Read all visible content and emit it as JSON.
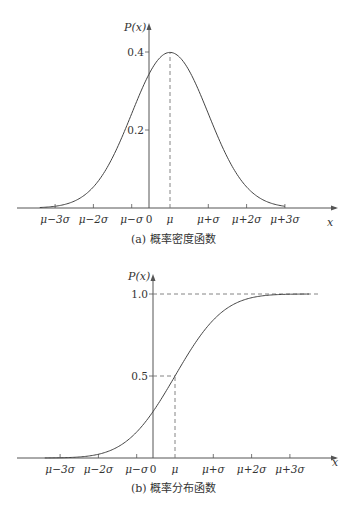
{
  "chart_data": [
    {
      "type": "line",
      "title": "",
      "caption": "(a) 概率密度函数",
      "xlabel": "x",
      "ylabel": "P(x)",
      "function": "normal_pdf",
      "mu_in_sigma_units": 0.55,
      "x_ticks": [
        "μ−3σ",
        "μ−2σ",
        "μ−σ",
        "0",
        "μ",
        "μ+σ",
        "μ+2σ",
        "μ+3σ"
      ],
      "x_tick_values_sigma": [
        -3,
        -2,
        -1,
        -0.55,
        0,
        1,
        2,
        3
      ],
      "y_ticks": [
        "0.2",
        "0.4"
      ],
      "y_tick_values": [
        0.2,
        0.4
      ],
      "ylim": [
        0,
        0.45
      ],
      "xlim_sigma": [
        -3.4,
        3.0
      ],
      "reference_lines": [
        {
          "type": "vertical-dashed",
          "at": "μ",
          "from": 0,
          "to": 0.4
        }
      ],
      "grid": false,
      "legend": "none"
    },
    {
      "type": "line",
      "title": "",
      "caption": "(b) 概率分布函数",
      "xlabel": "x",
      "ylabel": "P(x)",
      "function": "normal_cdf",
      "mu_in_sigma_units": 0.55,
      "x_ticks": [
        "μ−3σ",
        "μ−2σ",
        "μ−σ",
        "0",
        "μ",
        "μ+σ",
        "μ+2σ",
        "μ+3σ"
      ],
      "x_tick_values_sigma": [
        -3,
        -2,
        -1,
        -0.55,
        0,
        1,
        2,
        3
      ],
      "y_ticks": [
        "0.5",
        "1.0"
      ],
      "y_tick_values": [
        0.5,
        1.0
      ],
      "ylim": [
        0,
        1.1
      ],
      "xlim_sigma": [
        -3.4,
        3.5
      ],
      "reference_lines": [
        {
          "type": "horizontal-dashed",
          "at": 1.0
        },
        {
          "type": "horizontal-dashed",
          "at": 0.5,
          "to": "μ"
        },
        {
          "type": "vertical-dashed",
          "at": "μ",
          "from": 0,
          "to": 0.5
        }
      ],
      "grid": false,
      "legend": "none"
    }
  ]
}
